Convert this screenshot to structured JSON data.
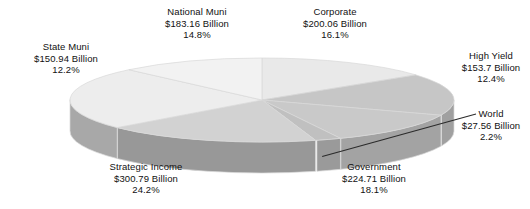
{
  "chart_data": {
    "type": "pie",
    "title": "",
    "subtitle": "",
    "xlabel": "",
    "ylabel": "",
    "legend_position": "labels-outside",
    "grid": false,
    "three_d": true,
    "value_unit": "Billion",
    "currency_symbol": "$",
    "categories": [
      "National Muni",
      "Corporate",
      "High Yield",
      "World",
      "Government",
      "Strategic Income",
      "State Muni"
    ],
    "values": [
      183.16,
      200.06,
      153.7,
      27.56,
      224.71,
      300.79,
      150.94
    ],
    "percentages": [
      14.8,
      16.1,
      12.4,
      2.2,
      18.1,
      24.2,
      12.2
    ],
    "slices": [
      {
        "name": "National Muni",
        "label_name": "National Muni",
        "value_text": "$183.16 Billion",
        "percent_text": "14.8%",
        "value": 183.16,
        "percent": 14.8,
        "top_color": "#e9e9e9",
        "side_color": "#b4b4b4",
        "has_leader_line": false
      },
      {
        "name": "Corporate",
        "label_name": "Corporate",
        "value_text": "$200.06 Billion",
        "percent_text": "16.1%",
        "value": 200.06,
        "percent": 16.1,
        "top_color": "#c6c6c6",
        "side_color": "#a0a0a0",
        "has_leader_line": false
      },
      {
        "name": "High Yield",
        "label_name": "High Yield",
        "value_text": "$153.7 Billion",
        "percent_text": "12.4%",
        "value": 153.7,
        "percent": 12.4,
        "top_color": "#c9c9c9",
        "side_color": "#a3a3a3",
        "has_leader_line": false
      },
      {
        "name": "World",
        "label_name": "World",
        "value_text": "$27.56 Billion",
        "percent_text": "2.2%",
        "value": 27.56,
        "percent": 2.2,
        "top_color": "#c0c0c0",
        "side_color": "#9a9a9a",
        "has_leader_line": true
      },
      {
        "name": "Government",
        "label_name": "Government",
        "value_text": "$224.71 Billion",
        "percent_text": "18.1%",
        "value": 224.71,
        "percent": 18.1,
        "top_color": "#d2d2d2",
        "side_color": "#989898",
        "has_leader_line": false
      },
      {
        "name": "Strategic Income",
        "label_name": "Strategic Income",
        "value_text": "$300.79 Billion",
        "percent_text": "24.2%",
        "value": 300.79,
        "percent": 24.2,
        "top_color": "#ededed",
        "side_color": "#a8a8a8",
        "has_leader_line": false
      },
      {
        "name": "State Muni",
        "label_name": "State Muni",
        "value_text": "$150.94 Billion",
        "percent_text": "12.2%",
        "value": 150.94,
        "percent": 12.2,
        "top_color": "#f2f2f2",
        "side_color": "#aeaeae",
        "has_leader_line": false
      }
    ],
    "colors": {
      "background": "#ffffff",
      "text": "#111111",
      "leader_line": "#2b2b2b",
      "slice_divider": "#d8d8d8"
    }
  }
}
